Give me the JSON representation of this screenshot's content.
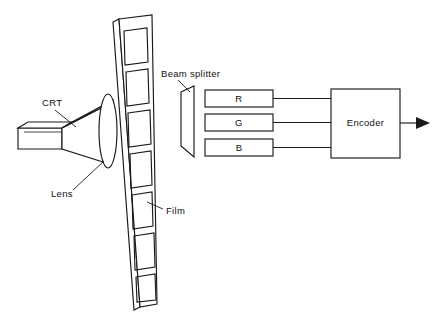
{
  "figure": {
    "domain": "diagram",
    "type": "schematic",
    "background_color": "#ffffff",
    "line_color": "#1a1a1a",
    "width": 440,
    "height": 326
  },
  "labels": {
    "crt": "CRT",
    "lens": "Lens",
    "film": "Film",
    "beam_splitter": "Beam splitter",
    "encoder": "Encoder"
  },
  "channels": [
    {
      "id": "r",
      "label": "R"
    },
    {
      "id": "g",
      "label": "G"
    },
    {
      "id": "b",
      "label": "B"
    }
  ],
  "components": [
    {
      "name": "crt",
      "label": "CRT",
      "shape": "funnel"
    },
    {
      "name": "lens",
      "label": "Lens",
      "shape": "ellipse"
    },
    {
      "name": "film",
      "label": "Film",
      "shape": "perforated-strip",
      "frames": 7
    },
    {
      "name": "beam-splitter",
      "label": "Beam splitter",
      "shape": "trapezoid"
    },
    {
      "name": "r-channel",
      "label": "R",
      "shape": "rectangle"
    },
    {
      "name": "g-channel",
      "label": "G",
      "shape": "rectangle"
    },
    {
      "name": "b-channel",
      "label": "B",
      "shape": "rectangle"
    },
    {
      "name": "encoder",
      "label": "Encoder",
      "shape": "rectangle"
    },
    {
      "name": "output",
      "label": "",
      "shape": "arrow"
    }
  ]
}
